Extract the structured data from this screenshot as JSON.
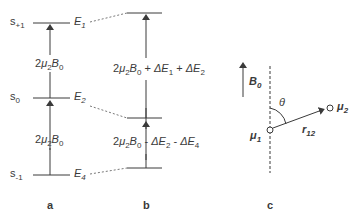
{
  "panel_a": {
    "label": "a",
    "levels": [
      {
        "state": "s",
        "state_sub": "+1",
        "energy": "E",
        "energy_sub": "1"
      },
      {
        "state": "s",
        "state_sub": "0",
        "energy": "E",
        "energy_sub": "2"
      },
      {
        "state": "s",
        "state_sub": "-1",
        "energy": "E",
        "energy_sub": "4"
      }
    ],
    "transitions": [
      {
        "prefix": "2",
        "mu": "μ",
        "mu_sub": "2",
        "field": "B",
        "field_sub": "0"
      },
      {
        "prefix": "2",
        "mu": "μ",
        "mu_sub": "2",
        "field": "B",
        "field_sub": "0"
      }
    ]
  },
  "panel_b": {
    "label": "b",
    "transitions": [
      {
        "prefix": "2",
        "mu": "μ",
        "mu_sub": "2",
        "field": "B",
        "field_sub": "0",
        "op1": " + ",
        "d1": "ΔE",
        "d1_sub": "1",
        "op2": " + ",
        "d2": "ΔE",
        "d2_sub": "2"
      },
      {
        "prefix": "2",
        "mu": "μ",
        "mu_sub": "2",
        "field": "B",
        "field_sub": "0",
        "op1": " - ",
        "d1": "ΔE",
        "d1_sub": "2",
        "op2": " - ",
        "d2": "ΔE",
        "d2_sub": "4"
      }
    ]
  },
  "panel_c": {
    "label": "c",
    "field": "B",
    "field_sub": "0",
    "angle": "θ",
    "dipole1": "μ",
    "dipole1_sub": "1",
    "dipole2": "μ",
    "dipole2_sub": "2",
    "vector": "r",
    "vector_sub": "12"
  },
  "colors": {
    "ink": "#3a3a3a",
    "dashed": "#555555"
  }
}
